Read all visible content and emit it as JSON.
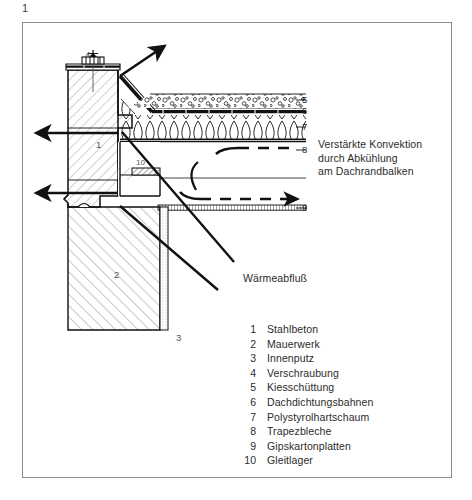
{
  "figure": {
    "number": "1"
  },
  "annotation": {
    "convection_note": "Verstärkte Konvektion\ndurch Abkühlung\nam Dachrandbalken",
    "heatflow_label": "Wärmeabfluß"
  },
  "callouts": {
    "c1": "1",
    "c2": "2",
    "c3": "3",
    "c4": "4",
    "c5": "5",
    "c6": "6",
    "c7": "7",
    "c8": "8",
    "c9": "9",
    "c10": "10"
  },
  "legend": {
    "items": [
      {
        "num": "1",
        "label": "Stahlbeton"
      },
      {
        "num": "2",
        "label": "Mauerwerk"
      },
      {
        "num": "3",
        "label": "Innenputz"
      },
      {
        "num": "4",
        "label": "Verschraubung"
      },
      {
        "num": "5",
        "label": "Kiesschüttung"
      },
      {
        "num": "6",
        "label": "Dachdichtungsbahnen"
      },
      {
        "num": "7",
        "label": "Polystyrolhartschaum"
      },
      {
        "num": "8",
        "label": "Trapezbleche"
      },
      {
        "num": "9",
        "label": "Gipskartonplatten"
      },
      {
        "num": "10",
        "label": "Gleitlager"
      }
    ]
  },
  "colors": {
    "ink": "#1a1a1a",
    "text": "#2b2b2b",
    "frame": "#8c8c8c",
    "hatch": "#6e6e6e",
    "paper": "#ffffff"
  }
}
